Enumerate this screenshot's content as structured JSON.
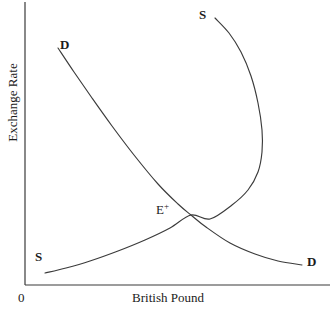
{
  "chart_data": {
    "type": "line",
    "title": "",
    "xlabel": "British Pound",
    "ylabel": "Exchange Rate",
    "origin_label": "0",
    "grid": false,
    "legend": "none",
    "axis_color": "#3a3a3a",
    "curve_color": "#3b3b3b",
    "background": "#ffffff",
    "xlim": [
      0,
      336
    ],
    "ylim": [
      0,
      311
    ],
    "axes": {
      "y_axis_x": 25,
      "x_axis_y": 285,
      "y_axis_top": 2,
      "x_axis_right": 330
    },
    "series": [
      {
        "name": "Demand",
        "label": "D",
        "label_start": "D",
        "label_end": "D",
        "shape": "downward-sloping convex",
        "points": [
          [
            58,
            48
          ],
          [
            74,
            72
          ],
          [
            92,
            98
          ],
          [
            112,
            126
          ],
          [
            134,
            155
          ],
          [
            158,
            184
          ],
          [
            178,
            204
          ],
          [
            191,
            215
          ],
          [
            206,
            227
          ],
          [
            230,
            243
          ],
          [
            255,
            254
          ],
          [
            278,
            261
          ],
          [
            302,
            265
          ]
        ]
      },
      {
        "name": "Supply",
        "label": "S",
        "label_start": "S",
        "label_end": "S",
        "shape": "backward-bending",
        "points": [
          [
            215,
            18
          ],
          [
            229,
            33
          ],
          [
            241,
            52
          ],
          [
            251,
            76
          ],
          [
            258,
            103
          ],
          [
            262,
            130
          ],
          [
            262,
            152
          ],
          [
            258,
            172
          ],
          [
            248,
            190
          ],
          [
            232,
            205
          ],
          [
            210,
            219
          ],
          [
            191,
            215
          ],
          [
            170,
            228
          ],
          [
            145,
            240
          ],
          [
            118,
            251
          ],
          [
            90,
            261
          ],
          [
            66,
            268
          ],
          [
            45,
            273
          ]
        ]
      }
    ],
    "annotations": [
      {
        "name": "equilibrium",
        "base": "E",
        "superscript": "+",
        "x": 191,
        "y": 215
      }
    ]
  },
  "labels": {
    "demand_top": "D",
    "demand_bottom": "D",
    "supply_top": "S",
    "supply_bottom": "S",
    "equilibrium_base": "E",
    "equilibrium_sup": "+",
    "origin": "0",
    "x_axis": "British Pound",
    "y_axis": "Exchange Rate"
  }
}
